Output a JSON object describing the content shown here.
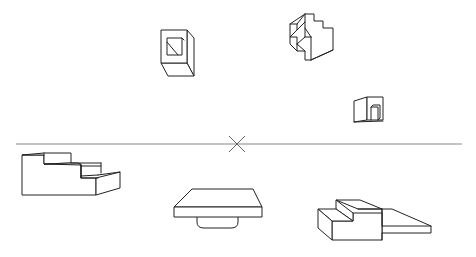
{
  "diagram": {
    "title": "One-point perspective drawing of blocks",
    "background": "#ffffff",
    "line_color": "#222222",
    "horizon": {
      "y": 144,
      "x_start": 16,
      "x_end": 462,
      "color": "#888888"
    },
    "vanishing_point": {
      "x": 237,
      "y": 144,
      "marker": "x-cross"
    },
    "shapes_above_horizon": [
      {
        "id": "hollow-cube",
        "description": "Cube with square window and diagonal line"
      },
      {
        "id": "zigzag-block",
        "description": "Stepped zig-zag block"
      },
      {
        "id": "small-box-door",
        "description": "Small box with doorway"
      }
    ],
    "shapes_below_horizon": [
      {
        "id": "staircase",
        "description": "Three-step staircase block"
      },
      {
        "id": "table-slab",
        "description": "Flat slab with rounded stub underneath"
      },
      {
        "id": "stepped-platform",
        "description": "Stepped block with low platform extension"
      }
    ]
  }
}
